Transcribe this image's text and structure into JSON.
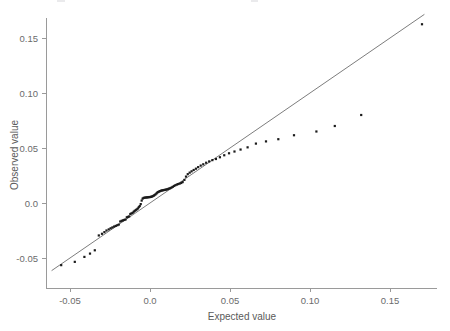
{
  "chart_data": {
    "type": "scatter",
    "title": "",
    "xlabel": "Expected value",
    "ylabel": "Observed value",
    "xlim": [
      -0.062,
      0.179
    ],
    "ylim": [
      -0.066,
      0.172
    ],
    "xticks": [
      -0.05,
      0.0,
      0.05,
      0.1,
      0.15
    ],
    "xticklabels": [
      "-0.05",
      "0.0",
      "0.05",
      "0.10",
      "0.15"
    ],
    "yticks": [
      -0.05,
      0.0,
      0.05,
      0.1,
      0.15
    ],
    "yticklabels": [
      "-0.05",
      "0.0",
      "0.05",
      "0.10",
      "0.15"
    ],
    "grid": false,
    "legend": null,
    "reference_line": {
      "name": "identity-line",
      "slope": 1.0,
      "intercept": 0.0,
      "x_start": -0.0615,
      "y_start": -0.0615,
      "x_end": 0.1715,
      "y_end": 0.1715
    },
    "series": [
      {
        "name": "qq-points",
        "marker": "square",
        "color": "#1b1b1b",
        "x": [
          -0.0555,
          -0.047,
          -0.041,
          -0.0375,
          -0.0345,
          -0.032,
          -0.03,
          -0.0285,
          -0.0272,
          -0.0258,
          -0.0246,
          -0.0235,
          -0.0224,
          -0.0214,
          -0.0204,
          -0.0195,
          -0.0186,
          -0.0177,
          -0.0169,
          -0.0161,
          -0.0153,
          -0.0145,
          -0.0138,
          -0.013,
          -0.0123,
          -0.0116,
          -0.0109,
          -0.0102,
          -0.0096,
          -0.0089,
          -0.0083,
          -0.0076,
          -0.007,
          -0.0064,
          -0.0058,
          -0.0052,
          -0.0046,
          -0.004,
          -0.0034,
          -0.0028,
          -0.0022,
          -0.0017,
          -0.0011,
          -0.0005,
          0.0,
          0.0006,
          0.0011,
          0.0017,
          0.0023,
          0.0028,
          0.0034,
          0.004,
          0.0045,
          0.0051,
          0.0057,
          0.0063,
          0.0069,
          0.0075,
          0.0081,
          0.0088,
          0.0094,
          0.0101,
          0.0107,
          0.0114,
          0.0121,
          0.0128,
          0.0136,
          0.0143,
          0.0151,
          0.0159,
          0.0168,
          0.0176,
          0.0185,
          0.0195,
          0.0204,
          0.0215,
          0.0225,
          0.0236,
          0.0248,
          0.026,
          0.0273,
          0.0287,
          0.0301,
          0.0317,
          0.0333,
          0.0351,
          0.037,
          0.039,
          0.0412,
          0.0437,
          0.0464,
          0.0494,
          0.0528,
          0.0566,
          0.061,
          0.0662,
          0.0725,
          0.0802,
          0.09,
          0.104,
          0.1155,
          0.132,
          0.17
        ],
        "y": [
          -0.0565,
          -0.0535,
          -0.049,
          -0.046,
          -0.043,
          -0.0295,
          -0.028,
          -0.0265,
          -0.025,
          -0.024,
          -0.023,
          -0.0222,
          -0.0214,
          -0.0208,
          -0.0202,
          -0.0196,
          -0.0168,
          -0.0162,
          -0.0158,
          -0.0154,
          -0.015,
          -0.013,
          -0.0126,
          -0.0122,
          -0.01,
          -0.0095,
          -0.009,
          -0.008,
          -0.0072,
          -0.0065,
          -0.0058,
          -0.005,
          -0.0038,
          -0.0028,
          -0.001,
          0.0022,
          0.004,
          0.0046,
          0.0048,
          0.005,
          0.005,
          0.0052,
          0.0052,
          0.0054,
          0.0054,
          0.0056,
          0.0058,
          0.0062,
          0.0066,
          0.0072,
          0.0078,
          0.0086,
          0.0094,
          0.01,
          0.0104,
          0.0108,
          0.0112,
          0.0114,
          0.0116,
          0.0118,
          0.012,
          0.0122,
          0.0124,
          0.0128,
          0.0132,
          0.0136,
          0.0142,
          0.0148,
          0.0155,
          0.0162,
          0.0168,
          0.0172,
          0.0176,
          0.0182,
          0.019,
          0.021,
          0.024,
          0.0262,
          0.0276,
          0.0288,
          0.03,
          0.0312,
          0.0326,
          0.034,
          0.0352,
          0.0366,
          0.0378,
          0.039,
          0.04,
          0.0416,
          0.0434,
          0.0452,
          0.0468,
          0.0486,
          0.0506,
          0.054,
          0.056,
          0.058,
          0.0616,
          0.065,
          0.07,
          0.08,
          0.1625
        ]
      }
    ]
  },
  "axes": {
    "x_title": "Expected value",
    "y_title": "Observed value"
  }
}
